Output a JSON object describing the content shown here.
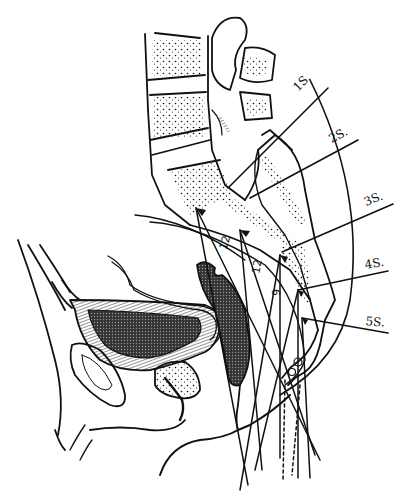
{
  "figure": {
    "sacral_labels": [
      {
        "id": "1s",
        "text": "1S."
      },
      {
        "id": "2s",
        "text": "2S."
      },
      {
        "id": "3s",
        "text": "3S."
      },
      {
        "id": "4s",
        "text": "4S."
      },
      {
        "id": "5s",
        "text": "5S."
      }
    ],
    "needle_depth_labels": [
      {
        "id": "needle-1",
        "text": "12"
      },
      {
        "id": "needle-2",
        "text": "12"
      },
      {
        "id": "needle-3",
        "text": "9"
      }
    ],
    "colors": {
      "ink": "#111111",
      "background": "#ffffff"
    }
  }
}
